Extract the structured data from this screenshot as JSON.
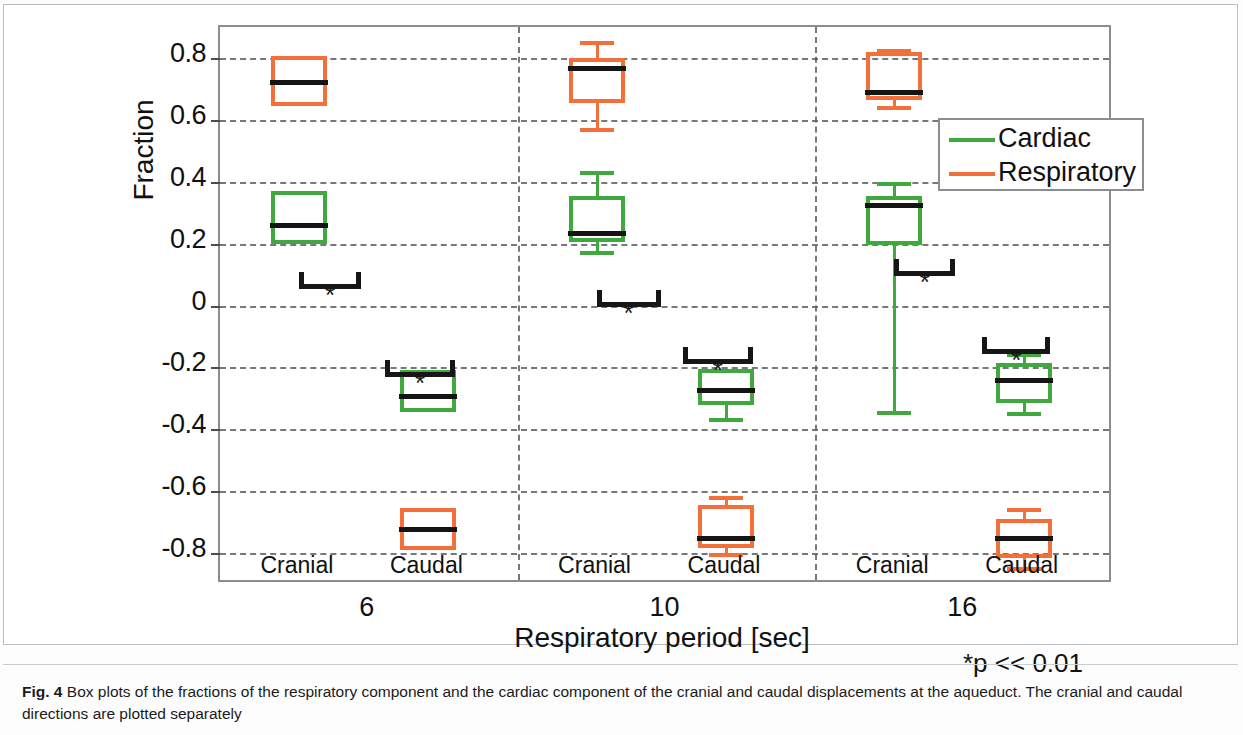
{
  "figure": {
    "label": "Fig. 4",
    "caption": "Box plots of the fractions of the respiratory component and the cardiac component of the cranial and caudal displacements at the aqueduct. The cranial and caudal directions are plotted separately",
    "significance_note": "*p << 0.01"
  },
  "legend": {
    "position": "top-right",
    "items": [
      {
        "label": "Cardiac",
        "color": "#3fa93f"
      },
      {
        "label": "Respiratory",
        "color": "#f4703a"
      }
    ]
  },
  "chart_data": {
    "type": "box",
    "title": "",
    "xlabel": "Respiratory period [sec]",
    "ylabel": "Fraction",
    "ylim": [
      -0.9,
      0.9
    ],
    "yticks": [
      0.8,
      0.6,
      0.4,
      0.2,
      0,
      -0.2,
      -0.4,
      -0.6,
      -0.8
    ],
    "ytick_labels": [
      "0.8",
      "0.6",
      "0.4",
      "0.2",
      "0",
      "-0.2",
      "-0.4",
      "-0.6",
      "-0.8"
    ],
    "grid": true,
    "groups": [
      "6",
      "10",
      "16"
    ],
    "subgroups": [
      "Cranial",
      "Caudal"
    ],
    "series": [
      {
        "name": "Cardiac",
        "color": "#3fa93f"
      },
      {
        "name": "Respiratory",
        "color": "#f4703a"
      }
    ],
    "boxes": [
      {
        "group": "6",
        "direction": "Cranial",
        "series": "Cardiac",
        "whisker_low": 0.2,
        "q1": 0.2,
        "median": 0.265,
        "q3": 0.37,
        "whisker_high": 0.37
      },
      {
        "group": "6",
        "direction": "Cranial",
        "series": "Respiratory",
        "whisker_low": 0.645,
        "q1": 0.645,
        "median": 0.73,
        "q3": 0.805,
        "whisker_high": 0.805
      },
      {
        "group": "6",
        "direction": "Caudal",
        "series": "Cardiac",
        "whisker_low": -0.345,
        "q1": -0.345,
        "median": -0.285,
        "q3": -0.21,
        "whisker_high": -0.21
      },
      {
        "group": "6",
        "direction": "Caudal",
        "series": "Respiratory",
        "whisker_low": -0.79,
        "q1": -0.79,
        "median": -0.715,
        "q3": -0.655,
        "whisker_high": -0.655
      },
      {
        "group": "10",
        "direction": "Cranial",
        "series": "Cardiac",
        "whisker_low": 0.175,
        "q1": 0.205,
        "median": 0.24,
        "q3": 0.355,
        "whisker_high": 0.435
      },
      {
        "group": "10",
        "direction": "Cranial",
        "series": "Respiratory",
        "whisker_low": 0.575,
        "q1": 0.655,
        "median": 0.775,
        "q3": 0.8,
        "whisker_high": 0.855
      },
      {
        "group": "10",
        "direction": "Caudal",
        "series": "Cardiac",
        "whisker_low": -0.365,
        "q1": -0.32,
        "median": -0.265,
        "q3": -0.205,
        "whisker_high": -0.205
      },
      {
        "group": "10",
        "direction": "Caudal",
        "series": "Respiratory",
        "whisker_low": -0.8,
        "q1": -0.785,
        "median": -0.745,
        "q3": -0.645,
        "whisker_high": -0.615
      },
      {
        "group": "16",
        "direction": "Cranial",
        "series": "Cardiac",
        "whisker_low": -0.34,
        "q1": 0.195,
        "median": 0.33,
        "q3": 0.355,
        "whisker_high": 0.4
      },
      {
        "group": "16",
        "direction": "Cranial",
        "series": "Respiratory",
        "whisker_low": 0.645,
        "q1": 0.665,
        "median": 0.695,
        "q3": 0.82,
        "whisker_high": 0.83
      },
      {
        "group": "16",
        "direction": "Caudal",
        "series": "Cardiac",
        "whisker_low": -0.345,
        "q1": -0.315,
        "median": -0.235,
        "q3": -0.185,
        "whisker_high": -0.155
      },
      {
        "group": "16",
        "direction": "Caudal",
        "series": "Respiratory",
        "whisker_low": -0.845,
        "q1": -0.815,
        "median": -0.745,
        "q3": -0.69,
        "whisker_high": -0.655
      }
    ],
    "significance_markers": [
      {
        "group": "6",
        "direction": "Cranial",
        "label": "*"
      },
      {
        "group": "6",
        "direction": "Caudal",
        "label": "*"
      },
      {
        "group": "10",
        "direction": "Cranial",
        "label": "*"
      },
      {
        "group": "10",
        "direction": "Caudal",
        "label": "*"
      },
      {
        "group": "16",
        "direction": "Cranial",
        "label": "*"
      },
      {
        "group": "16",
        "direction": "Caudal",
        "label": "*"
      }
    ]
  }
}
